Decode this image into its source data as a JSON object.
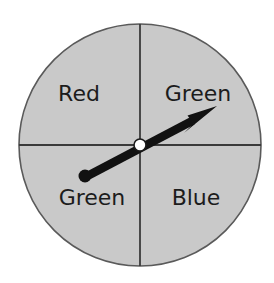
{
  "figure": {
    "name": "probability-spinner",
    "background_color": "#ffffff"
  },
  "spinner": {
    "center_x": 140,
    "center_y": 145,
    "radius": 121,
    "fill_color": "#c9c9c9",
    "outline_color": "#5a5a5a",
    "divider_color": "#3a3a3a",
    "hub": {
      "radius": 6,
      "fill_color": "#ffffff",
      "outline_color": "#1a1a1a"
    }
  },
  "sectors": [
    {
      "id": "sector-upper-left",
      "label": "Red",
      "position": "upper-left",
      "label_x": 79,
      "label_y": 101,
      "share": "1/4"
    },
    {
      "id": "sector-upper-right",
      "label": "Green",
      "position": "upper-right",
      "label_x": 198,
      "label_y": 101,
      "share": "1/4"
    },
    {
      "id": "sector-lower-left",
      "label": "Green",
      "position": "lower-left",
      "label_x": 92,
      "label_y": 205,
      "share": "1/4"
    },
    {
      "id": "sector-lower-right",
      "label": "Blue",
      "position": "lower-right",
      "label_x": 196,
      "label_y": 205,
      "share": "1/4"
    }
  ],
  "pointer": {
    "name": "spinner-arrow",
    "color": "#111111",
    "tail_x": 85,
    "tail_y": 176,
    "tip_x": 217,
    "tip_y": 107,
    "tail_dot_radius": 6,
    "shaft_width": 5,
    "arrowhead_length": 30,
    "arrowhead_half_width": 11,
    "points_to": "Green"
  }
}
